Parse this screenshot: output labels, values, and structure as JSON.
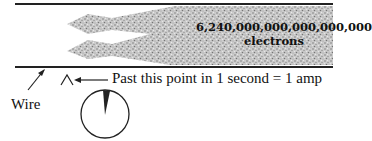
{
  "diagram": {
    "electron_count": "6,240,000,000,000,000,000",
    "electron_unit": "electrons",
    "wire_label": "Wire",
    "point_label": "Past this point in 1 second = 1 amp",
    "colors": {
      "line": "#222222",
      "electron_fill": "#a8a8a8",
      "text": "#111111"
    }
  }
}
